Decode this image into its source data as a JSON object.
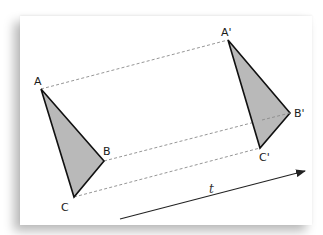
{
  "diagram": {
    "colors": {
      "triangle_fill": "#b9b9b9",
      "triangle_stroke": "#111111",
      "dashed_line": "#8a8a8a",
      "arrow": "#222222",
      "paper": "#ffffff"
    },
    "original_triangle": {
      "vertices": [
        {
          "label": "A",
          "x": 41,
          "y": 89
        },
        {
          "label": "B",
          "x": 104,
          "y": 161
        },
        {
          "label": "C",
          "x": 74,
          "y": 197
        }
      ]
    },
    "image_triangle": {
      "vertices": [
        {
          "label": "A'",
          "x": 228,
          "y": 40
        },
        {
          "label": "B'",
          "x": 290,
          "y": 113
        },
        {
          "label": "C'",
          "x": 260,
          "y": 148
        }
      ]
    },
    "correspondence_lines": [
      {
        "from": "A",
        "to": "A'",
        "style": "dashed"
      },
      {
        "from": "B",
        "to": "B'",
        "style": "dashed"
      },
      {
        "from": "C",
        "to": "C'",
        "style": "dashed"
      }
    ],
    "vector": {
      "label": "t",
      "start": {
        "x": 120,
        "y": 219
      },
      "end": {
        "x": 305,
        "y": 171
      }
    },
    "labels": {
      "A": "A",
      "B": "B",
      "C": "C",
      "A_prime": "A'",
      "B_prime": "B'",
      "C_prime": "C'",
      "t": "t"
    }
  }
}
